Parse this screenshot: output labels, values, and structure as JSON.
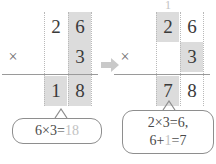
{
  "diagram": {
    "arrow_icon": "arrow-right-icon",
    "colors": {
      "highlight": "#dcdcdc",
      "digit": "#3a3a3a",
      "faint_digit": "#c2c2c2",
      "rule": "#9a9a9a",
      "guide": "#b9b9b9",
      "callout_border": "#8e8e8e",
      "arrow": "#c9c9c9",
      "background": "#ffffff"
    }
  },
  "steps": [
    {
      "name": "step-ones",
      "carry": {
        "tens": ""
      },
      "rows": {
        "multiplicand": {
          "tens": "2",
          "ones": "6"
        },
        "multiplier": {
          "tens": "",
          "ones": "3"
        },
        "product": {
          "tens": "1",
          "ones": "8"
        }
      },
      "operator": "×",
      "highlight": {
        "multiplicand": [
          "ones"
        ],
        "multiplier": [
          "ones"
        ],
        "product": [
          "tens",
          "ones"
        ]
      },
      "callout": {
        "lines": [
          {
            "plain_a": "6×3=",
            "faint": "18",
            "plain_b": ""
          }
        ]
      }
    },
    {
      "name": "step-tens",
      "carry": {
        "tens": "1"
      },
      "rows": {
        "multiplicand": {
          "tens": "2",
          "ones": "6"
        },
        "multiplier": {
          "tens": "",
          "ones": "3"
        },
        "product": {
          "tens": "7",
          "ones": "8"
        }
      },
      "operator": "×",
      "highlight": {
        "multiplicand": [
          "tens"
        ],
        "multiplier": [
          "ones"
        ],
        "product": [
          "tens"
        ]
      },
      "callout": {
        "lines": [
          {
            "plain_a": "2×3=6,",
            "faint": "",
            "plain_b": ""
          },
          {
            "plain_a": "6+",
            "faint": "1",
            "plain_b": "=7"
          }
        ]
      }
    }
  ]
}
